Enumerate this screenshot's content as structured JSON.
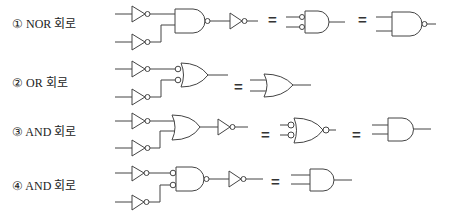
{
  "options": [
    {
      "label": "① NOR 회로"
    },
    {
      "label": "② OR 회로"
    },
    {
      "label": "③ AND 회로"
    },
    {
      "label": "④ AND 회로"
    }
  ],
  "symbols": {
    "equals": "="
  },
  "colors": {
    "line": "#444444",
    "background": "#ffffff"
  }
}
